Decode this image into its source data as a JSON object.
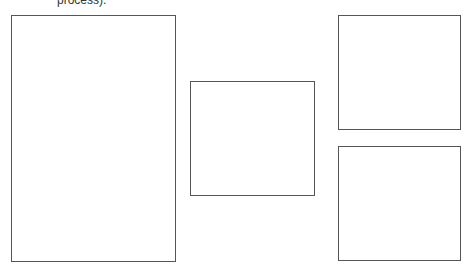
{
  "document": {
    "cut_off_text": "process)."
  },
  "boxes": [
    {
      "name": "left"
    },
    {
      "name": "middle"
    },
    {
      "name": "top-right"
    },
    {
      "name": "bottom-right"
    }
  ]
}
